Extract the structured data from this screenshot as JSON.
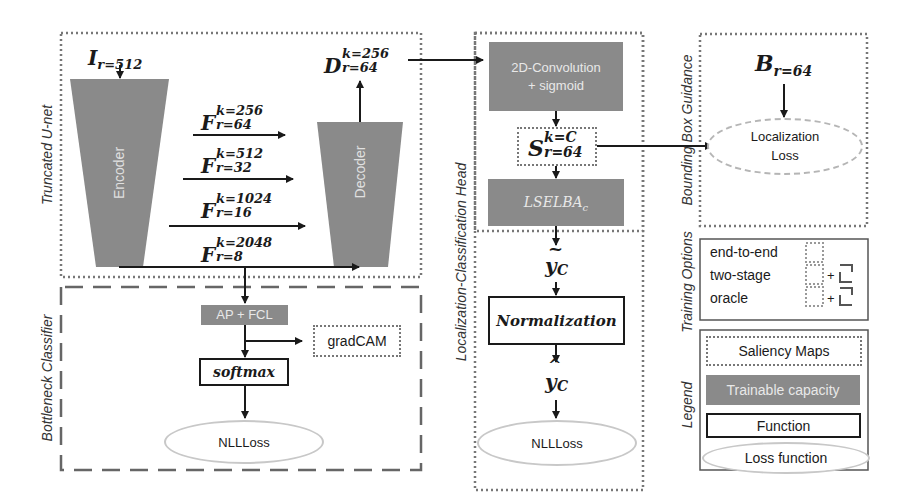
{
  "diagram": {
    "sections": {
      "truncated_unet": "Truncated U-net",
      "bottleneck_classifier": "Bottleneck Classifier",
      "localization_classification_head": "Localization-Classification Head",
      "bounding_box_guidance": "Bounding Box Guidance",
      "training_options": "Training Options",
      "legend": "Legend"
    },
    "unet": {
      "input": {
        "symbol": "I",
        "sub": "r=512"
      },
      "encoder_label": "Encoder",
      "decoder_label": "Decoder",
      "output": {
        "symbol": "D",
        "sup": "k=256",
        "sub": "r=64"
      },
      "skips": [
        {
          "symbol": "F",
          "sup": "k=256",
          "sub": "r=64"
        },
        {
          "symbol": "F",
          "sup": "k=512",
          "sub": "r=32"
        },
        {
          "symbol": "F",
          "sup": "k=1024",
          "sub": "r=16"
        },
        {
          "symbol": "F",
          "sup": "k=2048",
          "sub": "r=8"
        }
      ]
    },
    "bottleneck": {
      "ap_fcl": "AP + FCL",
      "gradcam": "gradCAM",
      "softmax": "softmax",
      "loss": "NLLLoss"
    },
    "head": {
      "conv": "2D-Convolution\n+ sigmoid",
      "conv_line1": "2D-Convolution",
      "conv_line2": "+ sigmoid",
      "saliency": {
        "symbol": "S",
        "sup": "k=C",
        "sub": "r=64"
      },
      "pooling": {
        "symbol": "LSELBA",
        "sub": "c"
      },
      "y_tilde": {
        "symbol": "y",
        "sub": "C",
        "accent": "~"
      },
      "normalization": "Normalization",
      "y_hat": {
        "symbol": "y",
        "sub": "C",
        "accent": "^"
      },
      "loss": "NLLLoss"
    },
    "bbox": {
      "input": {
        "symbol": "B",
        "sub": "r=64"
      },
      "loss_line1": "Localization",
      "loss_line2": "Loss"
    },
    "training_options": {
      "items": [
        {
          "label": "end-to-end",
          "plus": ""
        },
        {
          "label": "two-stage",
          "plus": "+"
        },
        {
          "label": "oracle",
          "plus": "+"
        }
      ]
    },
    "legend": {
      "saliency_maps": "Saliency Maps",
      "trainable_capacity": "Trainable capacity",
      "function": "Function",
      "loss_function": "Loss function"
    },
    "colors": {
      "trainable": "#8a8a8a",
      "loss_ellipse": "#c8c8c8",
      "border_dotted": "#777777",
      "text": "#1a1a1a"
    }
  }
}
